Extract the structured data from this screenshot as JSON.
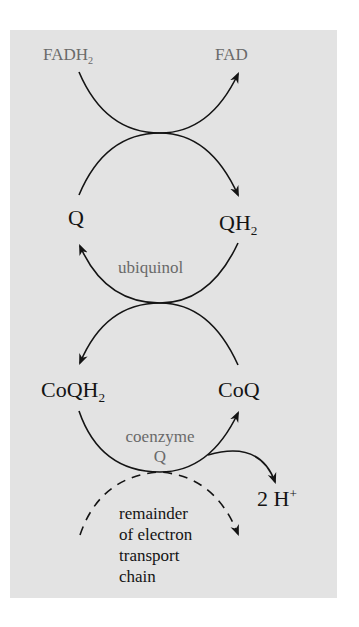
{
  "diagram": {
    "type": "coupled redox cycle",
    "colors": {
      "panel_background": "#e3e3e3",
      "page_background": "#ffffff",
      "primary_text": "#141414",
      "secondary_text": "#6a6a6a",
      "arrow": "#141414"
    },
    "nodes": {
      "fadh2": {
        "base": "FADH",
        "sub": "2"
      },
      "fad": {
        "label": "FAD"
      },
      "q": {
        "label": "Q"
      },
      "qh2": {
        "base": "QH",
        "sub": "2"
      },
      "ubiquinol": {
        "label": "ubiquinol"
      },
      "coqh2": {
        "base": "CoQH",
        "sub": "2"
      },
      "coq": {
        "label": "CoQ"
      },
      "coenzyme_q": {
        "line1": "coenzyme",
        "line2": "Q"
      },
      "protons": {
        "base": "2 H",
        "sup": "+"
      },
      "remainder": {
        "lines": [
          "remainder",
          "of electron",
          "transport",
          "chain"
        ]
      }
    },
    "edges": [
      {
        "from": "FADH2",
        "to": "FAD",
        "style": "solid"
      },
      {
        "from": "Q",
        "to": "QH2",
        "style": "solid"
      },
      {
        "from": "QH2",
        "to": "Q",
        "style": "solid"
      },
      {
        "from": "CoQ",
        "to": "CoQH2",
        "style": "solid"
      },
      {
        "from": "CoQH2",
        "to": "CoQ",
        "style": "solid"
      },
      {
        "from": "CoQH2 → CoQ",
        "to": "2 H+",
        "style": "solid"
      },
      {
        "from": "remainder of electron transport chain",
        "to": "remainder of electron transport chain",
        "style": "dashed"
      }
    ]
  }
}
